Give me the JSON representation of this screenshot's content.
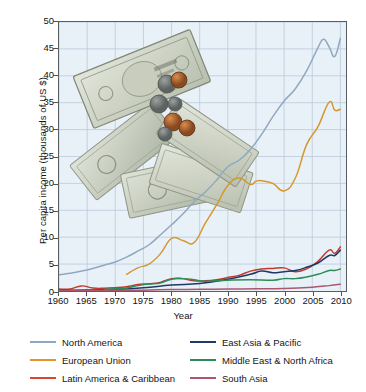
{
  "chart_data": {
    "type": "line",
    "title": "",
    "xlabel": "Year",
    "ylabel": "Per capita income (thousands of US $)",
    "xlim": [
      1960,
      2011
    ],
    "ylim": [
      0,
      50
    ],
    "xticks": [
      1960,
      1965,
      1970,
      1975,
      1980,
      1985,
      1990,
      1995,
      2000,
      2005,
      2010
    ],
    "yticks": [
      0,
      5,
      10,
      15,
      20,
      25,
      30,
      35,
      40,
      45,
      50
    ],
    "grid": true,
    "legend_position": "below-axes",
    "annotations": [
      "photo-of-us-dollar-bills-and-coins"
    ],
    "series": [
      {
        "name": "North America",
        "color": "#8fa8c0",
        "x": [
          1960,
          1962,
          1964,
          1966,
          1968,
          1970,
          1972,
          1974,
          1976,
          1978,
          1980,
          1982,
          1984,
          1986,
          1988,
          1990,
          1992,
          1994,
          1996,
          1998,
          2000,
          2002,
          2004,
          2006,
          2007,
          2008,
          2009,
          2010
        ],
        "values": [
          3.0,
          3.3,
          3.7,
          4.2,
          4.8,
          5.4,
          6.3,
          7.4,
          8.6,
          10.4,
          12.3,
          14.3,
          16.6,
          18.4,
          20.6,
          23.1,
          24.3,
          26.3,
          29.1,
          32.4,
          35.3,
          37.6,
          40.9,
          45.2,
          46.8,
          45.4,
          43.6,
          47.0
        ]
      },
      {
        "name": "European Union",
        "color": "#d4982f",
        "x": [
          1972,
          1974,
          1976,
          1978,
          1980,
          1982,
          1984,
          1986,
          1988,
          1990,
          1992,
          1994,
          1995,
          1996,
          1998,
          2000,
          2002,
          2004,
          2006,
          2008,
          2009,
          2010
        ],
        "values": [
          3.1,
          4.3,
          5.0,
          6.9,
          9.8,
          9.4,
          9.0,
          12.6,
          16.0,
          19.6,
          21.0,
          19.8,
          20.4,
          20.5,
          20.0,
          18.6,
          21.0,
          27.2,
          30.5,
          35.1,
          33.6,
          33.8
        ]
      },
      {
        "name": "Latin America & Caribbean",
        "color": "#c0392b",
        "x": [
          1960,
          1962,
          1964,
          1966,
          1968,
          1970,
          1972,
          1974,
          1976,
          1978,
          1980,
          1982,
          1984,
          1986,
          1988,
          1990,
          1992,
          1994,
          1996,
          1998,
          2000,
          2002,
          2004,
          2006,
          2008,
          2009,
          2010
        ],
        "values": [
          0.35,
          0.38,
          0.95,
          0.55,
          0.5,
          0.6,
          0.8,
          1.2,
          1.35,
          1.6,
          2.3,
          2.3,
          1.9,
          1.9,
          2.1,
          2.5,
          2.9,
          3.7,
          4.1,
          4.2,
          4.3,
          3.6,
          4.1,
          5.5,
          7.6,
          7.0,
          8.2
        ]
      },
      {
        "name": "East Asia & Pacific",
        "color": "#1f3864",
        "x": [
          1960,
          1965,
          1970,
          1975,
          1980,
          1985,
          1990,
          1994,
          1996,
          1998,
          2000,
          2002,
          2004,
          2006,
          2008,
          2009,
          2010
        ],
        "values": [
          0.13,
          0.17,
          0.3,
          0.6,
          1.1,
          1.4,
          2.2,
          3.1,
          3.7,
          3.4,
          3.6,
          3.8,
          4.4,
          5.2,
          6.6,
          6.6,
          7.6
        ]
      },
      {
        "name": "Middle East & North Africa",
        "color": "#2e8b57",
        "x": [
          1968,
          1970,
          1972,
          1974,
          1976,
          1978,
          1980,
          1982,
          1984,
          1986,
          1990,
          1994,
          1998,
          2000,
          2002,
          2004,
          2006,
          2008,
          2009,
          2010
        ],
        "values": [
          0.3,
          0.4,
          0.55,
          1.0,
          1.3,
          1.5,
          2.2,
          2.3,
          2.1,
          1.8,
          2.0,
          2.1,
          2.0,
          2.3,
          2.3,
          2.6,
          3.1,
          3.8,
          3.8,
          4.1
        ]
      },
      {
        "name": "South Asia",
        "color": "#a9586f",
        "x": [
          1960,
          1965,
          1970,
          1975,
          1980,
          1985,
          1990,
          1995,
          2000,
          2005,
          2008,
          2010
        ],
        "values": [
          0.08,
          0.1,
          0.12,
          0.16,
          0.27,
          0.31,
          0.38,
          0.4,
          0.47,
          0.71,
          1.0,
          1.25
        ]
      }
    ]
  },
  "axis": {
    "ylabel": "Per capita income (thousands of US $)",
    "xlabel": "Year",
    "ytick_labels": [
      "0",
      "5",
      "10",
      "15",
      "20",
      "25",
      "30",
      "35",
      "40",
      "45",
      "50"
    ],
    "xtick_labels": [
      "1960",
      "1965",
      "1970",
      "1975",
      "1980",
      "1985",
      "1990",
      "1995",
      "2000",
      "2005",
      "2010"
    ]
  },
  "legend": {
    "items": [
      {
        "label": "North America",
        "color": "#8fa8c0"
      },
      {
        "label": "East Asia & Pacific",
        "color": "#1f3864"
      },
      {
        "label": "European Union",
        "color": "#e8922c"
      },
      {
        "label": "Middle East & North Africa",
        "color": "#2e8b57"
      },
      {
        "label": "Latin America & Caribbean",
        "color": "#d9472f"
      },
      {
        "label": "South Asia",
        "color": "#a9586f"
      }
    ]
  },
  "style": {
    "plot_background": "#e9f1f8",
    "grid_color": "#b9c9da",
    "frame_color": "#5a5f63",
    "page_background": "#ffffff"
  }
}
